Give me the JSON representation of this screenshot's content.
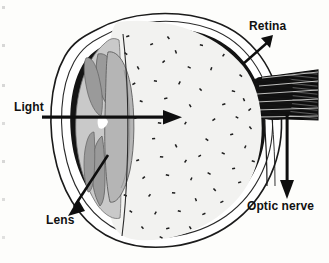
{
  "figure": {
    "type": "labeled-anatomical-diagram",
    "view": "sagittal cross-section, anterior at left, posterior at right",
    "background_color": "#fdfdfb",
    "ink_color": "#111111"
  },
  "labels": {
    "light": "Light",
    "lens": "Lens",
    "retina": "Retina",
    "optic_nerve": "Optic nerve"
  },
  "callouts": [
    {
      "id": "light",
      "text": "Light",
      "pointer": "straight horizontal arrow pointing right into the eye",
      "direction": "right"
    },
    {
      "id": "lens",
      "text": "Lens",
      "pointer": "straight arrow pointing down-left from the lens body",
      "direction": "down-left"
    },
    {
      "id": "retina",
      "text": "Retina",
      "pointer": "straight arrow pointing up-right from the inner back wall",
      "direction": "up-right"
    },
    {
      "id": "optic_nerve",
      "text": "Optic nerve",
      "pointer": "straight arrow pointing down from the nerve bundle",
      "direction": "down"
    }
  ],
  "structures": [
    {
      "name": "sclera-outline",
      "fill": "#ffffff",
      "stroke": "#111111",
      "note": "thin outer white coat outline"
    },
    {
      "name": "retina-choroid-band",
      "fill": "#111111",
      "note": "thick dark inner lining of the posterior globe"
    },
    {
      "name": "vitreous-body",
      "fill": "#f2f2f0",
      "note": "pale chamber stippled with small dark dashes"
    },
    {
      "name": "cornea-anterior-chamber",
      "fill": "#c9c9c9",
      "note": "mid-grey anterior bulge"
    },
    {
      "name": "iris-upper",
      "fill": "#9a9a9a"
    },
    {
      "name": "iris-lower",
      "fill": "#9a9a9a"
    },
    {
      "name": "lens-body",
      "fill": "#b5b5b5",
      "note": "biconvex grey lens behind the iris"
    },
    {
      "name": "optic-nerve-bundle",
      "fill": "#111111",
      "note": "dark hatched band leaving the back of the globe"
    }
  ],
  "colors": {
    "ink": "#111111",
    "vitreous": "#f2f2f0",
    "cornea_grey": "#c9c9c9",
    "iris_grey": "#9a9a9a",
    "lens_grey": "#b5b5b5",
    "page": "#fdfdfb"
  }
}
